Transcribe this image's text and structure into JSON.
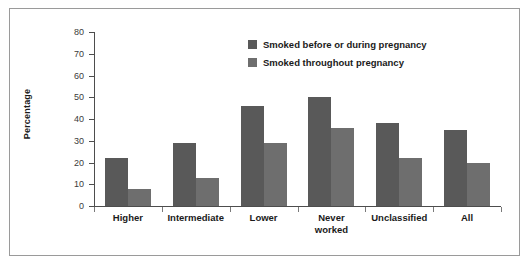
{
  "chart_data": {
    "type": "bar",
    "title": "",
    "xlabel": "",
    "ylabel": "Percentage",
    "ylim": [
      0,
      80
    ],
    "yticks": [
      0,
      10,
      20,
      30,
      40,
      50,
      60,
      70,
      80
    ],
    "grid": false,
    "legend_position": "top-center",
    "categories": [
      "Higher",
      "Intermediate",
      "Lower",
      "Never worked",
      "Unclassified",
      "All"
    ],
    "series": [
      {
        "name": "Smoked before or during pregnancy",
        "color": "#595959",
        "values": [
          22,
          29,
          46,
          50,
          38,
          35
        ]
      },
      {
        "name": "Smoked throughout pregnancy",
        "color": "#6e6e6e",
        "values": [
          8,
          13,
          29,
          36,
          22,
          20
        ]
      }
    ]
  },
  "axis": {
    "y_title": "Percentage",
    "tick_labels": [
      "80",
      "70",
      "60",
      "50",
      "40",
      "30",
      "20",
      "10",
      "0"
    ]
  },
  "colors": {
    "series_dark": "#595959",
    "series_light": "#6e6e6e",
    "axis": "#4d4d4d",
    "frame": "#9a9a9a",
    "text": "#1a1a1a",
    "background": "#ffffff"
  }
}
